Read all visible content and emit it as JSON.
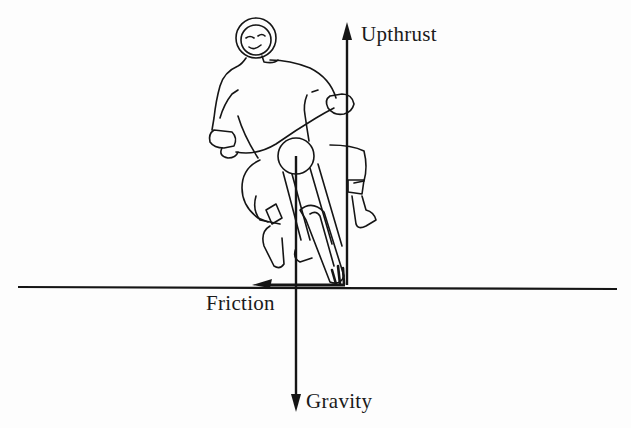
{
  "diagram": {
    "labels": {
      "upthrust": "Upthrust",
      "friction": "Friction",
      "gravity": "Gravity"
    },
    "forces": [
      {
        "name": "Upthrust",
        "direction": "up",
        "from": [
          347,
          285
        ],
        "to": [
          347,
          24
        ]
      },
      {
        "name": "Friction",
        "direction": "left",
        "from": [
          345,
          285
        ],
        "to": [
          253,
          285
        ]
      },
      {
        "name": "Gravity",
        "direction": "down",
        "from": [
          296,
          156
        ],
        "to": [
          296,
          410
        ]
      }
    ],
    "ground_line": {
      "from": [
        18,
        287
      ],
      "to": [
        617,
        289
      ]
    },
    "colors": {
      "ink": "#151515",
      "background": "#fdfdfd"
    }
  }
}
